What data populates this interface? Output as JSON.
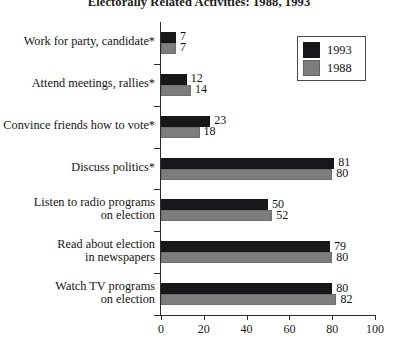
{
  "chart_data": {
    "type": "bar",
    "orientation": "horizontal",
    "title": "Electorally Related Activities: 1988, 1993",
    "xlabel": "",
    "ylabel": "",
    "xlim": [
      0,
      100
    ],
    "xticks": [
      0,
      20,
      40,
      60,
      80,
      100
    ],
    "grid": false,
    "legend_position": "top-right",
    "categories": [
      "Work for party, candidate*",
      "Attend meetings, rallies*",
      "Convince friends how to vote*",
      "Discuss politics*",
      "Listen to radio programs\non election",
      "Read about election\nin newspapers",
      "Watch TV programs\non election"
    ],
    "series": [
      {
        "name": "1993",
        "color": "#17171a",
        "values": [
          7,
          12,
          23,
          81,
          50,
          79,
          80
        ]
      },
      {
        "name": "1988",
        "color": "#7d7d7d",
        "values": [
          7,
          14,
          18,
          80,
          52,
          80,
          82
        ]
      }
    ]
  },
  "legend": {
    "entries": [
      {
        "label": "1993",
        "swatch": "swatch-1993"
      },
      {
        "label": "1988",
        "swatch": "swatch-1988"
      }
    ]
  }
}
